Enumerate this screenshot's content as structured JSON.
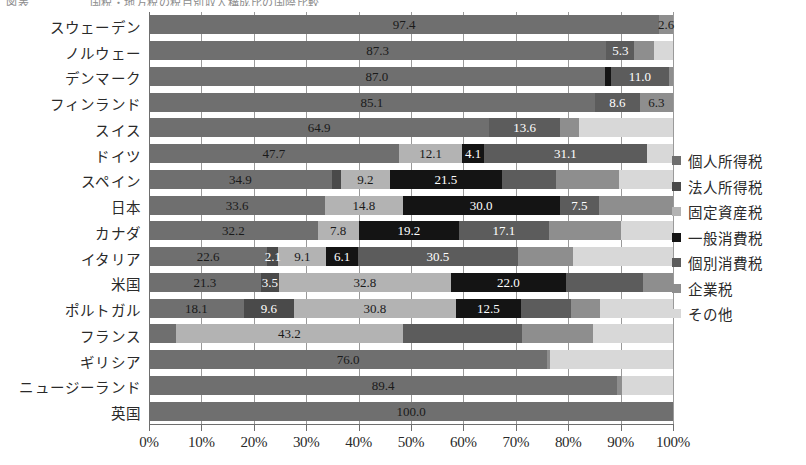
{
  "chart_title": "図表 　　　　　国税・地方税の税目別収入構成比の国際比較",
  "axis": {
    "xlabel": "",
    "ylabel": "",
    "xticks": [
      "0%",
      "10%",
      "20%",
      "30%",
      "40%",
      "50%",
      "60%",
      "70%",
      "80%",
      "90%",
      "100%"
    ],
    "xlim": [
      0,
      100
    ],
    "grid": true
  },
  "legend": {
    "position": "right",
    "items": [
      {
        "label": "個人所得税",
        "color": "#6f6f6f"
      },
      {
        "label": "法人所得税",
        "color": "#4a4a4a"
      },
      {
        "label": "固定資産税",
        "color": "#b3b3b3"
      },
      {
        "label": "一般消費税",
        "color": "#141414"
      },
      {
        "label": "個別消費税",
        "color": "#5c5c5c"
      },
      {
        "label": "企業税",
        "color": "#8e8e8e"
      },
      {
        "label": "その他",
        "color": "#d8d8d8"
      }
    ]
  },
  "chart_data": {
    "type": "bar",
    "orientation": "horizontal",
    "stacked": true,
    "title": "国税・地方税の税目別収入構成比の国際比較",
    "xlabel": "",
    "ylabel": "",
    "xlim": [
      0,
      100
    ],
    "unit": "%",
    "grid": true,
    "categories": [
      "スウェーデン",
      "ノルウェー",
      "デンマーク",
      "フィンランド",
      "スイス",
      "ドイツ",
      "スペイン",
      "日本",
      "カナダ",
      "イタリア",
      "米国",
      "ポルトガル",
      "フランス",
      "ギリシア",
      "ニュージーランド",
      "英国"
    ],
    "series": [
      {
        "name": "個人所得税",
        "color": "#6f6f6f",
        "values": [
          97.4,
          87.3,
          87.0,
          85.1,
          64.9,
          47.7,
          34.9,
          33.6,
          32.2,
          22.6,
          21.3,
          18.1,
          5.2,
          76.0,
          89.4,
          100.0
        ]
      },
      {
        "name": "法人所得税",
        "color": "#4a4a4a",
        "values": [
          0.0,
          0.0,
          0.0,
          0.0,
          0.0,
          0.0,
          1.8,
          0.0,
          0.0,
          2.1,
          3.5,
          9.6,
          0.0,
          0.0,
          0.0,
          0.0
        ]
      },
      {
        "name": "固定資産税",
        "color": "#b3b3b3",
        "values": [
          0.0,
          0.0,
          0.0,
          0.0,
          0.0,
          12.1,
          9.2,
          14.8,
          7.8,
          9.1,
          32.8,
          30.8,
          43.2,
          0.0,
          0.0,
          0.0
        ]
      },
      {
        "name": "一般消費税",
        "color": "#141414",
        "values": [
          0.0,
          0.0,
          1.2,
          0.0,
          0.0,
          4.1,
          21.5,
          30.0,
          19.2,
          6.1,
          22.0,
          12.5,
          0.0,
          0.0,
          0.0,
          0.0
        ]
      },
      {
        "name": "個別消費税",
        "color": "#5c5c5c",
        "values": [
          0.0,
          5.3,
          11.0,
          8.6,
          13.6,
          31.1,
          10.3,
          7.5,
          17.1,
          30.5,
          14.6,
          9.5,
          22.8,
          0.0,
          0.0,
          0.0
        ]
      },
      {
        "name": "企業税",
        "color": "#8e8e8e",
        "values": [
          2.6,
          3.8,
          0.8,
          6.3,
          3.5,
          0.0,
          12.0,
          14.1,
          13.8,
          10.6,
          5.8,
          5.5,
          13.6,
          0.6,
          0.9,
          0.0
        ]
      },
      {
        "name": "その他",
        "color": "#d8d8d8",
        "values": [
          0.0,
          3.6,
          0.0,
          0.0,
          18.0,
          5.0,
          10.3,
          0.0,
          9.9,
          19.0,
          0.0,
          14.0,
          15.2,
          23.4,
          9.7,
          0.0
        ]
      }
    ],
    "data_labels": {
      "スウェーデン": [
        {
          "series": "個人所得税",
          "text": "97.4"
        },
        {
          "series": "企業税",
          "text": "2.6"
        }
      ],
      "ノルウェー": [
        {
          "series": "個人所得税",
          "text": "87.3"
        },
        {
          "series": "個別消費税",
          "text": "5.3"
        }
      ],
      "デンマーク": [
        {
          "series": "個人所得税",
          "text": "87.0"
        },
        {
          "series": "個別消費税",
          "text": "11.0"
        }
      ],
      "フィンランド": [
        {
          "series": "個人所得税",
          "text": "85.1"
        },
        {
          "series": "個別消費税",
          "text": "8.6"
        },
        {
          "series": "企業税",
          "text": "6.3"
        }
      ],
      "スイス": [
        {
          "series": "個人所得税",
          "text": "64.9"
        },
        {
          "series": "個別消費税",
          "text": "13.6"
        }
      ],
      "ドイツ": [
        {
          "series": "個人所得税",
          "text": "47.7"
        },
        {
          "series": "固定資産税",
          "text": "12.1"
        },
        {
          "series": "一般消費税",
          "text": "4.1"
        },
        {
          "series": "個別消費税",
          "text": "31.1"
        }
      ],
      "スペイン": [
        {
          "series": "個人所得税",
          "text": "34.9"
        },
        {
          "series": "固定資産税",
          "text": "9.2"
        },
        {
          "series": "一般消費税",
          "text": "21.5"
        }
      ],
      "日本": [
        {
          "series": "個人所得税",
          "text": "33.6"
        },
        {
          "series": "固定資産税",
          "text": "14.8"
        },
        {
          "series": "一般消費税",
          "text": "30.0"
        },
        {
          "series": "個別消費税",
          "text": "7.5"
        }
      ],
      "カナダ": [
        {
          "series": "個人所得税",
          "text": "32.2"
        },
        {
          "series": "固定資産税",
          "text": "7.8"
        },
        {
          "series": "一般消費税",
          "text": "19.2"
        },
        {
          "series": "個別消費税",
          "text": "17.1"
        }
      ],
      "イタリア": [
        {
          "series": "個人所得税",
          "text": "22.6"
        },
        {
          "series": "法人所得税",
          "text": "2.1"
        },
        {
          "series": "固定資産税",
          "text": "9.1"
        },
        {
          "series": "一般消費税",
          "text": "6.1"
        },
        {
          "series": "個別消費税",
          "text": "30.5"
        }
      ],
      "米国": [
        {
          "series": "個人所得税",
          "text": "21.3"
        },
        {
          "series": "法人所得税",
          "text": "3.5"
        },
        {
          "series": "固定資産税",
          "text": "32.8"
        },
        {
          "series": "一般消費税",
          "text": "22.0"
        }
      ],
      "ポルトガル": [
        {
          "series": "個人所得税",
          "text": "18.1"
        },
        {
          "series": "法人所得税",
          "text": "9.6"
        },
        {
          "series": "固定資産税",
          "text": "30.8"
        },
        {
          "series": "一般消費税",
          "text": "12.5"
        }
      ],
      "フランス": [
        {
          "series": "固定資産税",
          "text": "43.2"
        }
      ],
      "ギリシア": [
        {
          "series": "個人所得税",
          "text": "76.0"
        }
      ],
      "ニュージーランド": [
        {
          "series": "個人所得税",
          "text": "89.4"
        }
      ],
      "英国": [
        {
          "series": "個人所得税",
          "text": "100.0"
        }
      ]
    }
  }
}
